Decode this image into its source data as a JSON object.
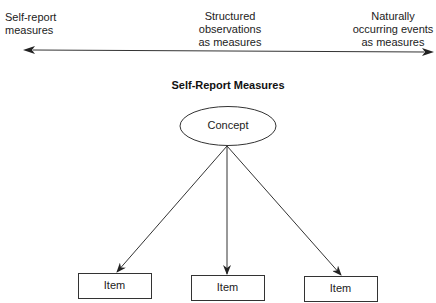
{
  "continuum": {
    "left_label": [
      "Self-report",
      "measures"
    ],
    "middle_label": [
      "Structured",
      "observations",
      "as measures"
    ],
    "right_label": [
      "Naturally",
      "occurring events",
      "as measures"
    ]
  },
  "diagram": {
    "title": "Self-Report Measures",
    "concept": "Concept",
    "items": [
      {
        "label": "Item"
      },
      {
        "label": "Item"
      },
      {
        "label": "Item"
      }
    ]
  },
  "colors": {
    "line": "#333333",
    "text": "#222222",
    "background": "#ffffff"
  }
}
